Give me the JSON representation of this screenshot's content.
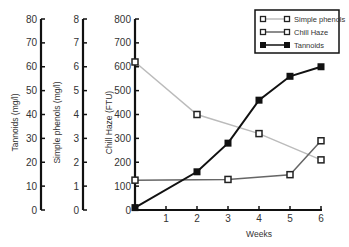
{
  "chart_data": {
    "type": "line",
    "title": "",
    "xlabel": "Weeks",
    "x": [
      0,
      2,
      3,
      4,
      5,
      6
    ],
    "x_ticks": [
      "1",
      "2",
      "3",
      "4",
      "5",
      "6"
    ],
    "xlim": [
      0,
      6
    ],
    "axes": [
      {
        "label": "Tannoids (mg/l)",
        "ylim": [
          0,
          80
        ],
        "ticks": [
          "0",
          "10",
          "20",
          "30",
          "40",
          "50",
          "60",
          "70",
          "80"
        ]
      },
      {
        "label": "Simple phenols (mg/l)",
        "ylim": [
          0,
          8
        ],
        "ticks": [
          "0",
          "1",
          "2",
          "3",
          "4",
          "5",
          "6",
          "7",
          "8"
        ]
      },
      {
        "label": "Chill Haze (FTU)",
        "ylim": [
          0,
          800
        ],
        "ticks": [
          "0",
          "100",
          "200",
          "300",
          "400",
          "500",
          "600",
          "700",
          "800"
        ]
      }
    ],
    "series": [
      {
        "name": "Simple phenols",
        "axis": "Simple phenols (mg/l)",
        "x": [
          0,
          2,
          4,
          6
        ],
        "values": [
          6.2,
          4.0,
          3.2,
          2.1
        ],
        "color": "#bbbbbb",
        "marker": "hollow-square"
      },
      {
        "name": "Chill Haze",
        "axis": "Chill Haze (FTU)",
        "x": [
          0,
          3,
          5,
          6
        ],
        "values": [
          125,
          128,
          148,
          290
        ],
        "color": "#666666",
        "marker": "hollow-square"
      },
      {
        "name": "Tannoids",
        "axis": "Tannoids (mg/l)",
        "x": [
          0,
          2,
          3,
          4,
          5,
          6
        ],
        "values": [
          1,
          16,
          28,
          46,
          56,
          60
        ],
        "color": "#111111",
        "marker": "filled-square"
      }
    ],
    "legend": {
      "position": "top-right",
      "entries": [
        "Simple phenols",
        "Chill Haze",
        "Tannoids"
      ]
    },
    "grid": false
  }
}
